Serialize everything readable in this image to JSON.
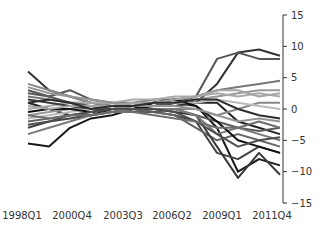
{
  "chart_data": {
    "type": "line",
    "title": "",
    "xlabel": "",
    "ylabel": "",
    "ylim": [
      -15,
      15
    ],
    "yticks": [
      15,
      10,
      5,
      0,
      -5,
      -10,
      -15
    ],
    "y_axis_position": "right",
    "grid": false,
    "legend": "none",
    "x_tick_labels": [
      "1998Q1",
      "2000Q4",
      "2003Q3",
      "2006Q2",
      "2009Q1",
      "2011Q4"
    ],
    "x_start_label": "1998Q1",
    "n_points": 56,
    "note": "Approx. 20 series in shades of gray/black; values are estimated from pixels, sampled every 5 quarters beginning 1998Q1",
    "x": [
      "1998Q1",
      "1999Q2",
      "2000Q3",
      "2001Q4",
      "2003Q1",
      "2004Q2",
      "2005Q3",
      "2006Q4",
      "2008Q1",
      "2009Q2",
      "2010Q3",
      "2011Q4",
      "2012Q4"
    ],
    "series": [
      {
        "name": "s1",
        "color": "#1a1a1a",
        "values": [
          -5.5,
          -6,
          -3,
          -1.5,
          -1,
          0,
          0.5,
          1,
          0.5,
          -3,
          -10,
          -8,
          -9
        ]
      },
      {
        "name": "s2",
        "color": "#333333",
        "values": [
          6,
          3,
          2,
          1,
          0.5,
          0.5,
          1,
          0.5,
          1,
          4,
          9,
          9.5,
          8.5
        ]
      },
      {
        "name": "s3",
        "color": "#555555",
        "values": [
          3,
          2,
          3,
          1.5,
          1,
          0.5,
          0.5,
          1,
          2,
          8,
          9,
          8,
          8
        ]
      },
      {
        "name": "s4",
        "color": "#222222",
        "values": [
          1,
          0,
          -1,
          -1,
          0,
          0.5,
          1,
          1.5,
          1,
          1,
          -2,
          -3,
          -4
        ]
      },
      {
        "name": "s5",
        "color": "#777777",
        "values": [
          2,
          1.5,
          1,
          1,
          1,
          1,
          1.5,
          1.5,
          2,
          3,
          3.5,
          4,
          4.5
        ]
      },
      {
        "name": "s6",
        "color": "#999999",
        "values": [
          -1,
          -0.5,
          0,
          0.5,
          0.5,
          1,
          1,
          1,
          1.5,
          2,
          2.5,
          3,
          3
        ]
      },
      {
        "name": "s7",
        "color": "#444444",
        "values": [
          -3,
          -2,
          -1.5,
          -1,
          -0.5,
          0,
          -0.5,
          -1,
          -2,
          -7,
          -8,
          -6,
          -7
        ]
      },
      {
        "name": "s8",
        "color": "#888888",
        "values": [
          4,
          3,
          2,
          1,
          0.5,
          0,
          0,
          0,
          0,
          -1,
          0,
          1,
          1
        ]
      },
      {
        "name": "s9",
        "color": "#666666",
        "values": [
          -2,
          -1.5,
          -1,
          -0.5,
          0,
          0,
          -0.5,
          -1,
          -3,
          -5,
          -4,
          -5,
          -6
        ]
      },
      {
        "name": "s10",
        "color": "#aaaaaa",
        "values": [
          0,
          0.5,
          1,
          1,
          1,
          1.5,
          1.5,
          2,
          2,
          2.5,
          2,
          2.5,
          2
        ]
      },
      {
        "name": "s11",
        "color": "#3a3a3a",
        "values": [
          1.5,
          1,
          0.5,
          0,
          0,
          0,
          0,
          -0.5,
          -1,
          -6,
          -11,
          -7,
          -10.5
        ]
      },
      {
        "name": "s12",
        "color": "#bbbbbb",
        "values": [
          -1.5,
          -1,
          -0.5,
          0,
          0.5,
          0.5,
          1,
          1,
          1,
          1.5,
          1,
          0.5,
          0
        ]
      },
      {
        "name": "s13",
        "color": "#5a5a5a",
        "values": [
          2.5,
          2,
          1,
          0.5,
          0,
          -0.5,
          -0.5,
          0,
          -1,
          -2,
          -3,
          -3.5,
          -3
        ]
      },
      {
        "name": "s14",
        "color": "#7a7a7a",
        "values": [
          -4,
          -3,
          -2,
          -1,
          -0.5,
          0,
          0,
          0,
          -1,
          -4,
          -3,
          -4,
          -5
        ]
      },
      {
        "name": "s15",
        "color": "#111111",
        "values": [
          -0.5,
          0,
          0,
          -0.5,
          0,
          0,
          1,
          1.5,
          0.5,
          -2,
          -5,
          -6,
          -7
        ]
      },
      {
        "name": "s16",
        "color": "#959595",
        "values": [
          3.5,
          2.5,
          2,
          1.5,
          1,
          0.5,
          0.5,
          0.5,
          0,
          -1,
          -2,
          -1.5,
          -2
        ]
      },
      {
        "name": "s17",
        "color": "#4d4d4d",
        "values": [
          -2.5,
          -2,
          -1,
          -0.5,
          0,
          0,
          0,
          -0.5,
          -2,
          -4,
          -6,
          -5,
          -4.5
        ]
      },
      {
        "name": "s18",
        "color": "#a5a5a5",
        "values": [
          0.5,
          0,
          0.5,
          0.5,
          0.5,
          1,
          1,
          1.5,
          2,
          3,
          3,
          2,
          2.5
        ]
      },
      {
        "name": "s19",
        "color": "#2e2e2e",
        "values": [
          1,
          1.5,
          1,
          0,
          0.5,
          0.5,
          1,
          1,
          1.5,
          1.5,
          0,
          -1,
          -1.5
        ]
      },
      {
        "name": "s20",
        "color": "#6e6e6e",
        "values": [
          -1,
          -1.5,
          -1,
          -1,
          -0.5,
          -0.5,
          -1,
          -1.5,
          -2,
          -3,
          -3,
          -2,
          -3
        ]
      }
    ]
  }
}
